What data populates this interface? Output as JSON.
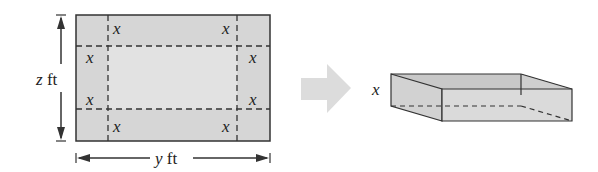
{
  "diagram": {
    "sheet": {
      "corner_cut_label": "x",
      "height_label_var": "z",
      "height_label_unit": "ft",
      "width_label_var": "y",
      "width_label_unit": "ft"
    },
    "box": {
      "height_label": "x"
    },
    "colors": {
      "sheet_fill": "#d6d6d6",
      "inner_fill": "#e0e0e0",
      "line": "#333333",
      "arrow": "#dcdcdc"
    }
  }
}
